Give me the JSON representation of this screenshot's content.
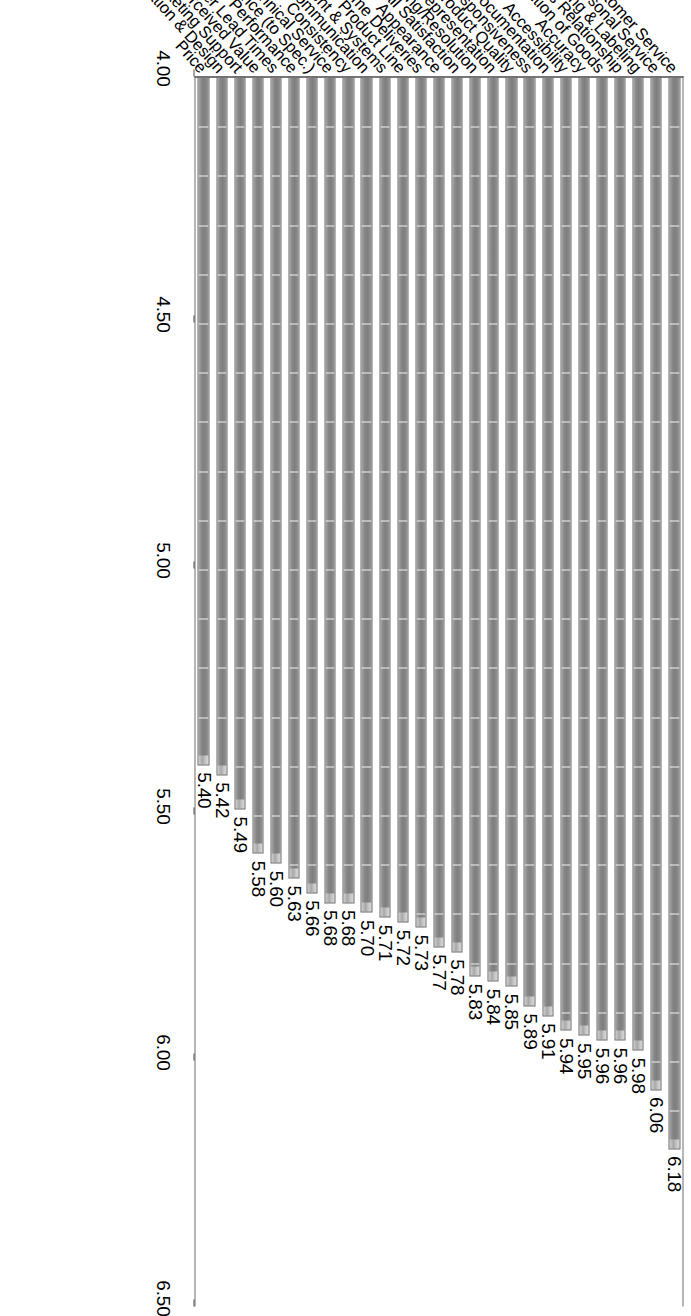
{
  "chart_data": {
    "type": "bar",
    "orientation": "horizontal",
    "title": "",
    "subtitle": "",
    "xlabel": "",
    "ylabel": "",
    "grid": true,
    "legend": false,
    "legend_position": "none",
    "value_axis": {
      "min": 4.0,
      "max": 6.5,
      "ticks": [
        "6.50",
        "6.00",
        "5.50",
        "5.00",
        "4.50",
        "4.00"
      ],
      "tick_values": [
        6.5,
        6.0,
        5.5,
        5.0,
        4.5,
        4.0
      ],
      "baseline": 4.0,
      "step": 0.5
    },
    "bar_color": "#808080",
    "bar_cap_color": "#cccccc",
    "axis_color": "#3a3a3a",
    "gridline_color": "#f2f2f2",
    "categories": [
      "Customer Service",
      "Personal Service",
      "Packaging & Labeling",
      "Business Relationship",
      "Condition of Goods",
      "Accuracy",
      "Accessibility",
      "Documentation",
      "Responsiveness",
      "Overall Product Quality",
      "Sales Representation",
      "Complaint Handling/Resolution",
      "Overall Satisfaction",
      "Appearance",
      "On-Time Deliveries",
      "Product Line",
      "Equipment & Systems",
      "Communication",
      "Consistency",
      "Technical Service",
      "Adherence (to Spec.)",
      "Performance",
      "Order Lead Times",
      "Perceived Value",
      "Marketing Support",
      "Innovation & Design",
      "Price"
    ],
    "values": [
      6.18,
      6.06,
      5.98,
      5.96,
      5.96,
      5.95,
      5.94,
      5.91,
      5.89,
      5.85,
      5.84,
      5.83,
      5.78,
      5.77,
      5.73,
      5.72,
      5.71,
      5.7,
      5.68,
      5.68,
      5.66,
      5.63,
      5.6,
      5.58,
      5.49,
      5.42,
      5.4
    ],
    "value_labels": [
      "6.18",
      "6.06",
      "5.98",
      "5.96",
      "5.96",
      "5.95",
      "5.94",
      "5.91",
      "5.89",
      "5.85",
      "5.84",
      "5.83",
      "5.78",
      "5.77",
      "5.73",
      "5.72",
      "5.71",
      "5.70",
      "5.68",
      "5.68",
      "5.66",
      "5.63",
      "5.60",
      "5.58",
      "5.49",
      "5.42",
      "5.40"
    ]
  }
}
